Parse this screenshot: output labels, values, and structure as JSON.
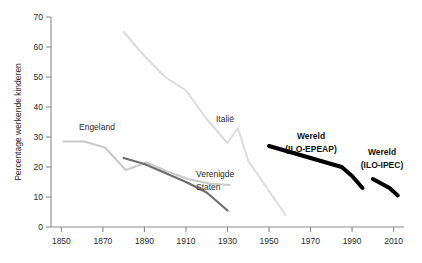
{
  "chart_data": {
    "type": "line",
    "title": "",
    "xlabel": "",
    "ylabel": "Percentage werkende kinderen",
    "xlim": [
      1845,
      2015
    ],
    "ylim": [
      0,
      70
    ],
    "grid": false,
    "legend_position": "inline-annotations",
    "xticks": [
      1850,
      1870,
      1890,
      1910,
      1930,
      1950,
      1970,
      1990,
      2010
    ],
    "xtick_labels": [
      "1850",
      "1870",
      "1890",
      "1910",
      "1930",
      "1950",
      "1970",
      "1990",
      "2010"
    ],
    "yticks": [
      0,
      10,
      20,
      30,
      40,
      50,
      60,
      70
    ],
    "ytick_labels": [
      "0",
      "10",
      "20",
      "30",
      "40",
      "50",
      "60",
      "70"
    ],
    "series": [
      {
        "name": "Engeland",
        "label": "Engeland",
        "color": "#c9c9c9",
        "width": 2.0,
        "style": "thin-light",
        "x": [
          1851,
          1861,
          1871,
          1881,
          1891,
          1901,
          1911,
          1921,
          1931
        ],
        "values": [
          28.5,
          28.5,
          26.5,
          19.0,
          21.5,
          18.5,
          16.0,
          14.5,
          14.0
        ]
      },
      {
        "name": "Verenigde Staten",
        "label": "Verenigde Staten",
        "color": "#6e6e6e",
        "width": 2.2,
        "style": "thin-dark",
        "x": [
          1880,
          1890,
          1900,
          1910,
          1920,
          1930
        ],
        "values": [
          23.0,
          21.0,
          18.0,
          15.0,
          11.5,
          5.5
        ]
      },
      {
        "name": "Italië",
        "label": "Italië",
        "color": "#dcdcdc",
        "width": 2.0,
        "style": "thin-light",
        "x": [
          1880,
          1890,
          1900,
          1910,
          1920,
          1930,
          1935,
          1940,
          1950,
          1955,
          1958
        ],
        "values": [
          65.0,
          57.0,
          50.0,
          45.5,
          36.0,
          28.0,
          33.0,
          22.0,
          12.0,
          7.0,
          4.0
        ]
      },
      {
        "name": "Wereld (ILO-EPEAP)",
        "label": "Wereld\n(ILO-EPEAP)",
        "label_line1": "Wereld",
        "label_line2": "(ILO-EPEAP)",
        "color": "#000000",
        "width": 4.0,
        "style": "thick-black",
        "x": [
          1950,
          1960,
          1970,
          1980,
          1985,
          1990,
          1995
        ],
        "values": [
          27.0,
          25.0,
          23.0,
          21.0,
          20.0,
          17.0,
          13.0
        ]
      },
      {
        "name": "Wereld (ILO-IPEC)",
        "label": "Wereld\n(ILO-IPEC)",
        "label_line1": "Wereld",
        "label_line2": "(ILO-IPEC)",
        "color": "#000000",
        "width": 4.0,
        "style": "thick-black",
        "x": [
          2000,
          2004,
          2008,
          2012
        ],
        "values": [
          16.0,
          14.5,
          13.0,
          10.5
        ]
      }
    ],
    "annotations": [
      {
        "text": "Engeland",
        "x": 1868,
        "y": 32.5
      },
      {
        "text": "Verenigde Staten",
        "x": 1912,
        "y": 12.5
      },
      {
        "text": "Italië",
        "x": 1929,
        "y": 36.0
      },
      {
        "text": "Wereld (ILO-EPEAP)",
        "x": 1972,
        "y": 31.0
      },
      {
        "text": "Wereld (ILO-IPEC)",
        "x": 2002,
        "y": 25.0
      }
    ]
  }
}
